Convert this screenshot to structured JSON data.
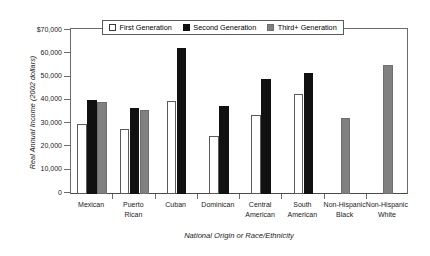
{
  "chart_data": {
    "type": "bar",
    "title": "",
    "xlabel": "National Origin or Race/Ethnicity",
    "ylabel": "Real Annual Income (2002 dollars)",
    "ylim": [
      0,
      70000
    ],
    "ytick_labels": [
      "$70,000",
      "60,000",
      "50,000",
      "40,000",
      "30,000",
      "20,000",
      "10,000",
      "0"
    ],
    "ytick_values": [
      70000,
      60000,
      50000,
      40000,
      30000,
      20000,
      10000,
      0
    ],
    "grid": false,
    "legend_position": "top-center",
    "categories": [
      "Mexican",
      "Puerto Rican",
      "Cuban",
      "Dominican",
      "Central American",
      "South American",
      "Non-Hispanic Black",
      "Non-Hispanic White"
    ],
    "category_lines": [
      [
        "Mexican"
      ],
      [
        "Puerto",
        "Rican"
      ],
      [
        "Cuban"
      ],
      [
        "Dominican"
      ],
      [
        "Central",
        "American"
      ],
      [
        "South",
        "American"
      ],
      [
        "Non-Hispanic",
        "Black"
      ],
      [
        "Non-Hispanic",
        "White"
      ]
    ],
    "series": [
      {
        "name": "First Generation",
        "color": "#ffffff",
        "values": [
          30000,
          28000,
          40000,
          25000,
          34000,
          43000,
          null,
          null
        ]
      },
      {
        "name": "Second Generation",
        "color": "#111111",
        "values": [
          40500,
          37000,
          62500,
          38000,
          49500,
          52000,
          null,
          null
        ]
      },
      {
        "name": "Third+ Generation",
        "color": "#808080",
        "values": [
          39500,
          36000,
          null,
          null,
          null,
          null,
          32500,
          55500
        ]
      }
    ]
  },
  "legend": {
    "items": [
      {
        "label": "First Generation",
        "swatch": "gen1"
      },
      {
        "label": "Second Generation",
        "swatch": "gen2"
      },
      {
        "label": "Third+ Generation",
        "swatch": "gen3"
      }
    ]
  },
  "colors": {
    "first_generation": "#ffffff",
    "second_generation": "#111111",
    "third_generation": "#808080",
    "axis": "#6b6b6b",
    "background": "#ffffff"
  }
}
